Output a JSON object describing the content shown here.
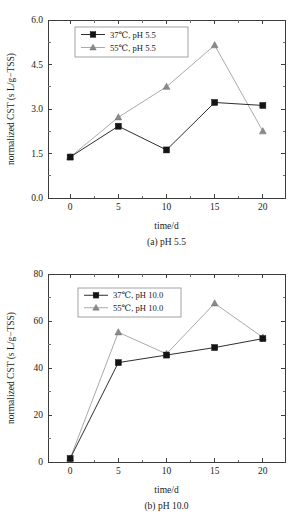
{
  "figure": {
    "panel_a_caption": "(a)  pH 5.5",
    "panel_b_caption": "(b)  pH 10.0"
  },
  "chart_data": [
    {
      "type": "line",
      "id": "panel-a",
      "title": "(a)  pH 5.5",
      "xlabel": "time/d",
      "ylabel": "normalized CST (s L/g−TSS)",
      "x": [
        0,
        5,
        10,
        15,
        20
      ],
      "xticklabels": [
        "0",
        "5",
        "10",
        "15",
        "20"
      ],
      "yticks": [
        0.0,
        1.5,
        3.0,
        4.5,
        6.0
      ],
      "yticklabels": [
        "0.0",
        "1.5",
        "3.0",
        "4.5",
        "6.0"
      ],
      "xlim": [
        -2.3,
        22.3
      ],
      "ylim": [
        0.0,
        6.0
      ],
      "grid": false,
      "legend_position": "upper-left-inside",
      "series": [
        {
          "name": "37℃, pH 5.5",
          "marker": "square",
          "color": "#141414",
          "line_color": "#2e2e2e",
          "values": [
            1.38,
            2.42,
            1.62,
            3.22,
            3.12
          ]
        },
        {
          "name": "55℃, pH 5.5",
          "marker": "triangle",
          "color": "#8a8a8a",
          "line_color": "#aaaaaa",
          "values": [
            1.38,
            2.72,
            3.75,
            5.15,
            2.25
          ]
        }
      ]
    },
    {
      "type": "line",
      "id": "panel-b",
      "title": "(b)  pH 10.0",
      "xlabel": "time/d",
      "ylabel": "normalized CST (s L/g−TSS)",
      "x": [
        0,
        5,
        10,
        15,
        20
      ],
      "xticklabels": [
        "0",
        "5",
        "10",
        "15",
        "20"
      ],
      "yticks": [
        0,
        20,
        40,
        60,
        80
      ],
      "yticklabels": [
        "0",
        "20",
        "40",
        "60",
        "80"
      ],
      "xlim": [
        -2.3,
        22.3
      ],
      "ylim": [
        0,
        80
      ],
      "grid": false,
      "legend_position": "upper-left-inside",
      "series": [
        {
          "name": "37℃, pH 10.0",
          "marker": "square",
          "color": "#141414",
          "line_color": "#2e2e2e",
          "values": [
            1.5,
            42.3,
            45.5,
            48.7,
            52.5
          ]
        },
        {
          "name": "55℃, pH 10.0",
          "marker": "triangle",
          "color": "#8a8a8a",
          "line_color": "#aaaaaa",
          "values": [
            1.5,
            55.2,
            46.0,
            67.5,
            53.0
          ]
        }
      ]
    }
  ]
}
